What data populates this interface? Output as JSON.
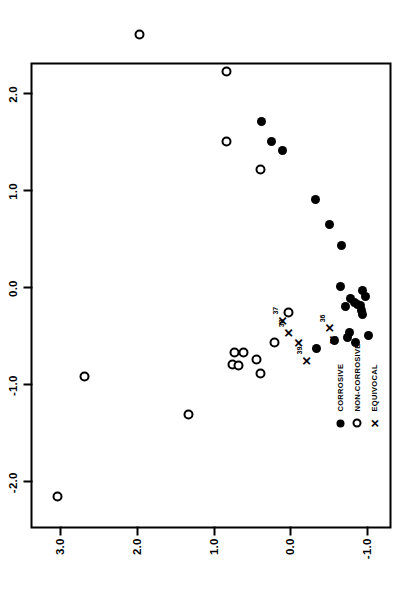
{
  "chart_data": {
    "type": "scatter",
    "title": "",
    "xlabel": "Principal Component 1",
    "ylabel": "",
    "xlim": [
      -2.45,
      2.35
    ],
    "ylim": [
      -1.35,
      3.35
    ],
    "xticks": [
      -2.0,
      -1.0,
      0.0,
      1.0,
      2.0
    ],
    "xticklabels": [
      "-2.0",
      "-1.0",
      "0.0",
      "1.0",
      "2.0"
    ],
    "yticks": [
      -1.0,
      0.0,
      1.0,
      2.0,
      3.0
    ],
    "yticklabels": [
      "-1.0",
      "0.0",
      "1.0",
      "2.0",
      "3.0"
    ],
    "grid": false,
    "legend_position": "lower-left",
    "series": [
      {
        "name": "CORROSIVE",
        "marker": "filled-circle",
        "color": "#000000",
        "points": [
          {
            "x": 1.72,
            "y": 0.37
          },
          {
            "x": 1.52,
            "y": 0.24
          },
          {
            "x": 1.42,
            "y": 0.09
          },
          {
            "x": 0.92,
            "y": -0.34
          },
          {
            "x": 0.66,
            "y": -0.52
          },
          {
            "x": 0.44,
            "y": -0.67
          },
          {
            "x": 0.02,
            "y": -0.66
          },
          {
            "x": -0.02,
            "y": -0.95
          },
          {
            "x": -0.1,
            "y": -0.79
          },
          {
            "x": -0.14,
            "y": -0.84
          },
          {
            "x": -0.16,
            "y": -0.88
          },
          {
            "x": -0.17,
            "y": -0.92
          },
          {
            "x": -0.08,
            "y": -0.98
          },
          {
            "x": -0.23,
            "y": -0.93
          },
          {
            "x": -0.27,
            "y": -0.95
          },
          {
            "x": -0.18,
            "y": -0.72
          },
          {
            "x": -0.45,
            "y": -0.78
          },
          {
            "x": -0.55,
            "y": -0.86
          },
          {
            "x": -0.48,
            "y": -1.02
          },
          {
            "x": -0.62,
            "y": -0.35
          },
          {
            "x": -0.53,
            "y": -0.58
          },
          {
            "x": -0.5,
            "y": -0.75
          }
        ]
      },
      {
        "name": "NON-CORROSIVE",
        "marker": "open-circle",
        "color": "#000000",
        "points": [
          {
            "x": 2.62,
            "y": 1.96
          },
          {
            "x": 2.24,
            "y": 0.82
          },
          {
            "x": 1.52,
            "y": 0.82
          },
          {
            "x": 1.23,
            "y": 0.38
          },
          {
            "x": -0.9,
            "y": 2.67
          },
          {
            "x": -1.3,
            "y": 1.32
          },
          {
            "x": -0.25,
            "y": 0.02
          },
          {
            "x": -0.55,
            "y": 0.2
          },
          {
            "x": -0.66,
            "y": 0.6
          },
          {
            "x": -0.66,
            "y": 0.72
          },
          {
            "x": -0.78,
            "y": 0.75
          },
          {
            "x": -0.79,
            "y": 0.67
          },
          {
            "x": -0.73,
            "y": 0.44
          },
          {
            "x": -0.87,
            "y": 0.38
          },
          {
            "x": -2.14,
            "y": 3.02
          }
        ]
      },
      {
        "name": "EQUIVOCAL",
        "marker": "x",
        "color": "#000000",
        "points": [
          {
            "x": -0.33,
            "y": 0.1,
            "label": "37"
          },
          {
            "x": -0.46,
            "y": 0.02,
            "label": "38"
          },
          {
            "x": -0.56,
            "y": -0.11,
            "label": ""
          },
          {
            "x": -0.74,
            "y": -0.22,
            "label": "39"
          },
          {
            "x": -0.41,
            "y": -0.52,
            "label": "36"
          },
          {
            "x": -0.53,
            "y": -0.57,
            "label": ""
          }
        ]
      }
    ]
  },
  "axes": {
    "x_title": "Principal Component 1"
  },
  "legend": {
    "items": [
      {
        "label": "CORROSIVE",
        "marker": "filled-circle"
      },
      {
        "label": "NON-CORROSIVE",
        "marker": "open-circle"
      },
      {
        "label": "EQUIVOCAL",
        "marker": "x"
      }
    ]
  },
  "glyphs": {
    "x_marker": "✕"
  }
}
